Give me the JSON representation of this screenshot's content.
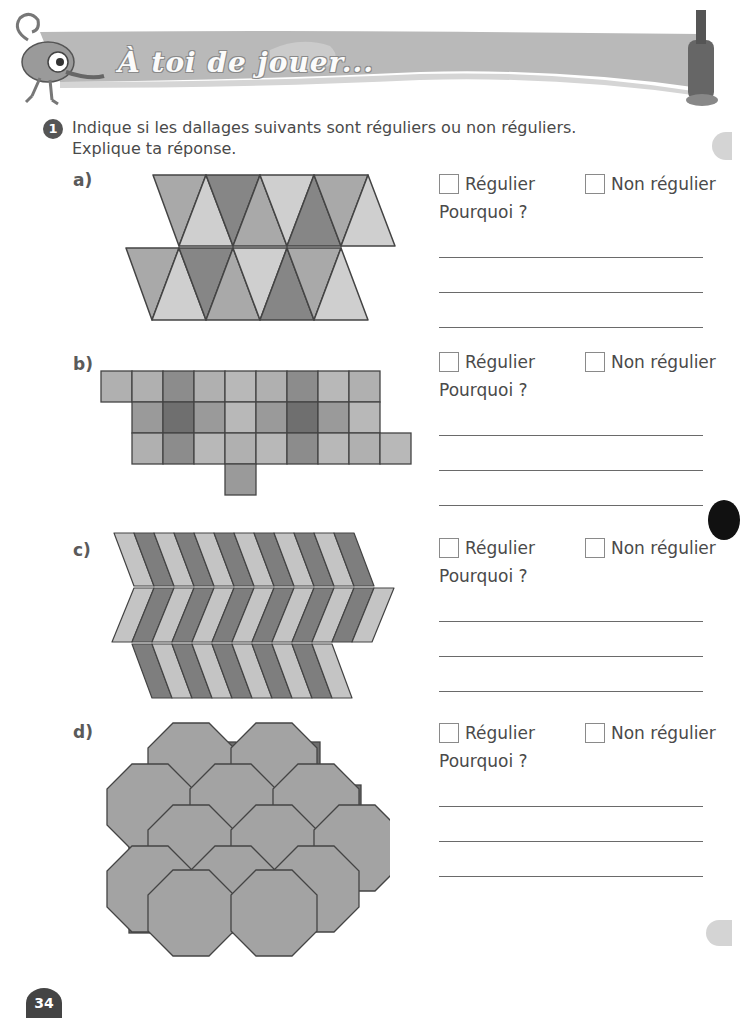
{
  "header": {
    "title": "À toi de jouer...",
    "mascot_icon": "chameleon-icon",
    "right_icon": "paint-tube-icon"
  },
  "exercise": {
    "number": "1",
    "instruction_line1": "Indique si les dallages suivants sont réguliers ou non réguliers.",
    "instruction_line2": "Explique ta réponse."
  },
  "items": [
    {
      "label": "a)",
      "pattern": "triangles",
      "option_regular": "Régulier",
      "option_non_regular": "Non régulier",
      "why": "Pourquoi ?",
      "answer_lines": 3
    },
    {
      "label": "b)",
      "pattern": "squares",
      "option_regular": "Régulier",
      "option_non_regular": "Non régulier",
      "why": "Pourquoi ?",
      "answer_lines": 3
    },
    {
      "label": "c)",
      "pattern": "chevrons",
      "option_regular": "Régulier",
      "option_non_regular": "Non régulier",
      "why": "Pourquoi ?",
      "answer_lines": 3
    },
    {
      "label": "d)",
      "pattern": "octagons-and-squares",
      "option_regular": "Régulier",
      "option_non_regular": "Non régulier",
      "why": "Pourquoi ?",
      "answer_lines": 3
    }
  ],
  "footer": {
    "page_number": "34"
  },
  "colors": {
    "light": "#cfcfcf",
    "mid": "#a9a9a9",
    "dark": "#868686",
    "darker": "#6a6a6a",
    "stroke": "#444444"
  }
}
